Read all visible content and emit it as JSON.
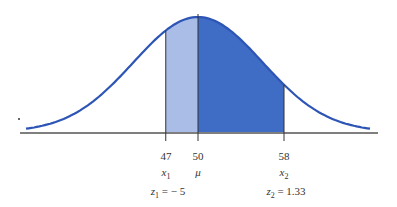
{
  "chart_data": {
    "type": "area",
    "title": "",
    "mean": 50,
    "sd": 6,
    "x_ticks": [
      {
        "value": "47",
        "var": "x",
        "sub": "1",
        "z": "z",
        "zsub": "1",
        "zval": " = − 5"
      },
      {
        "value": "50",
        "var": "μ"
      },
      {
        "value": "58",
        "var": "x",
        "sub": "2",
        "z": "z",
        "zsub": "2",
        "zval": " = 1.33"
      }
    ],
    "shaded_regions": [
      {
        "from": 47,
        "to": 50,
        "color": "#a9bde6"
      },
      {
        "from": 50,
        "to": 58,
        "color": "#3f6cc4"
      }
    ],
    "curve_color": "#2d55b5"
  }
}
